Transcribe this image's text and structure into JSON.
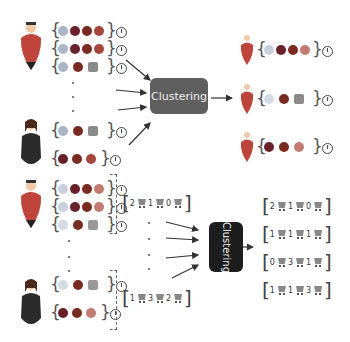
{
  "top_section": {
    "cluster_label": "Clustering",
    "users": [
      {
        "type": "male",
        "sessions": [
          {
            "items": [
              "candy",
              "bean",
              "tomato",
              "apple"
            ],
            "has_clock": true
          },
          {
            "items": [
              "candy",
              "bean",
              "tomato",
              "apple"
            ],
            "has_clock": true
          },
          {
            "items": [
              "candy",
              "tomato",
              "bottle"
            ],
            "has_clock": true
          }
        ]
      },
      {
        "type": "female",
        "sessions": [
          {
            "items": [
              "candy",
              "tomato",
              "bottle"
            ],
            "has_clock": true
          },
          {
            "items": [
              "bean",
              "tomato",
              "apple"
            ],
            "has_clock": true
          }
        ]
      }
    ],
    "clusters": [
      {
        "items": [
          "candy",
          "bean",
          "tomato",
          "apple"
        ],
        "has_clock": true
      },
      {
        "items": [
          "candy",
          "tomato",
          "bottle"
        ],
        "has_clock": true
      },
      {
        "items": [
          "bean",
          "tomato",
          "apple"
        ],
        "has_clock": true
      }
    ]
  },
  "bottom_section": {
    "cluster_label": "Clustering",
    "user_vectors": [
      {
        "values": [
          "2",
          "1",
          "0"
        ]
      },
      {
        "values": [
          "1",
          "3",
          "2"
        ]
      }
    ],
    "cluster_vectors": [
      {
        "values": [
          "2",
          "1",
          "0"
        ]
      },
      {
        "values": [
          "1",
          "1",
          "1"
        ]
      },
      {
        "values": [
          "0",
          "3",
          "1"
        ]
      },
      {
        "values": [
          "1",
          "1",
          "3"
        ]
      }
    ]
  },
  "colors": {
    "cluster_box_top": "#5f5f5f",
    "cluster_box_bottom": "#1d1d1d",
    "male_body": "#c0443a",
    "female_body": "#2b2b2b"
  }
}
